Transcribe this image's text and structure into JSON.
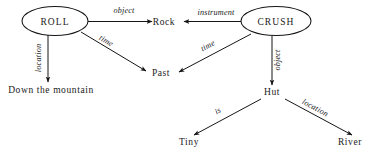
{
  "diagram": {
    "type": "semantic-network",
    "title": "",
    "nodes": [
      {
        "id": "roll",
        "label": "ROLL",
        "shape": "ellipse",
        "cx": 55,
        "cy": 21,
        "rx": 33,
        "ry": 14
      },
      {
        "id": "crush",
        "label": "CRUSH",
        "shape": "ellipse",
        "cx": 276,
        "cy": 22,
        "rx": 35,
        "ry": 14
      },
      {
        "id": "rock",
        "label": "Rock",
        "shape": "text",
        "x": 164,
        "y": 25
      },
      {
        "id": "past",
        "label": "Past",
        "shape": "text",
        "x": 161,
        "y": 75
      },
      {
        "id": "mountain",
        "label": "Down the mountain",
        "shape": "text",
        "x": 51,
        "y": 92
      },
      {
        "id": "hut",
        "label": "Hut",
        "shape": "text",
        "x": 272,
        "y": 94
      },
      {
        "id": "tiny",
        "label": "Tiny",
        "shape": "text",
        "x": 189,
        "y": 144
      },
      {
        "id": "river",
        "label": "River",
        "shape": "text",
        "x": 350,
        "y": 144
      }
    ],
    "edges": [
      {
        "id": "roll-rock",
        "label": "object",
        "from": "roll",
        "to": "rock",
        "label_x": 124,
        "label_y": 13,
        "label_rotate": 0
      },
      {
        "id": "crush-rock",
        "label": "instrument",
        "from": "crush",
        "to": "rock",
        "label_x": 216,
        "label_y": 15,
        "label_rotate": 0
      },
      {
        "id": "roll-mountain",
        "label": "location",
        "from": "roll",
        "to": "mountain",
        "label_x": 41,
        "label_y": 58,
        "label_rotate": -90
      },
      {
        "id": "roll-past",
        "label": "time",
        "from": "roll",
        "to": "past",
        "label_x": 105,
        "label_y": 43,
        "label_rotate": 34
      },
      {
        "id": "crush-past",
        "label": "time",
        "from": "crush",
        "to": "past",
        "label_x": 208,
        "label_y": 48,
        "label_rotate": -27
      },
      {
        "id": "crush-hut",
        "label": "object",
        "from": "crush",
        "to": "hut",
        "label_x": 279,
        "label_y": 59,
        "label_rotate": -90
      },
      {
        "id": "hut-tiny",
        "label": "is",
        "from": "hut",
        "to": "tiny",
        "label_x": 219,
        "label_y": 113,
        "label_rotate": -28
      },
      {
        "id": "hut-river",
        "label": "location",
        "from": "hut",
        "to": "river",
        "label_x": 314,
        "label_y": 110,
        "label_rotate": 28
      }
    ],
    "colors": {
      "stroke": "#161616",
      "text": "#1a1a1a",
      "background": "#ffffff"
    }
  }
}
